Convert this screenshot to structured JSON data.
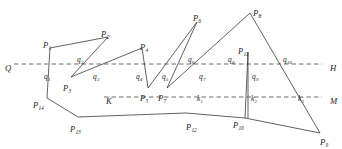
{
  "figure": {
    "type": "geometry-diagram",
    "width": 342,
    "height": 149,
    "background_color": "#ffffff",
    "stroke_color": "#3a3a3a",
    "dash_color": "#5a5a5a"
  },
  "axes": [
    {
      "id": "line-QH",
      "left_label": "Q",
      "right_label": "H",
      "y": 64,
      "x_start": 14,
      "x_end": 322,
      "style": "dashed"
    },
    {
      "id": "line-KM",
      "left_label": "K",
      "right_label": "M",
      "y": 97,
      "x_start": 104,
      "x_end": 322,
      "style": "dashed"
    }
  ],
  "axis_labels": [
    {
      "name": "axis-label-Q",
      "base": "Q",
      "sub": "",
      "x": 5,
      "y": 58
    },
    {
      "name": "axis-label-H",
      "base": "H",
      "sub": "",
      "x": 330,
      "y": 58
    },
    {
      "name": "axis-label-K",
      "base": "K",
      "sub": "",
      "x": 106,
      "y": 91
    },
    {
      "name": "axis-label-M",
      "base": "M",
      "sub": "",
      "x": 330,
      "y": 91
    }
  ],
  "chain": {
    "name": "polygon-chain",
    "points": "50,48 108,37 71,77 142,48 148,88 197,22 167,88 250,13 320,133 245,118 248,52 248,118 245,118 186,113 47,110 47,98 50,48",
    "vertex_order": [
      "P1",
      "P2",
      "P3",
      "P4",
      "P5",
      "P6",
      "P7",
      "P8",
      "P9",
      "P10",
      "P11",
      "P10",
      "P12",
      "P13",
      "P14",
      "P1"
    ]
  },
  "segments": [
    {
      "name": "segment-P1-P2",
      "d": "M 50,48 L 108,37"
    },
    {
      "name": "segment-P2-P3",
      "d": "M 108,37 L 71,77"
    },
    {
      "name": "segment-P3-P4",
      "d": "M 71,77 L 142,48"
    },
    {
      "name": "segment-P4-P5",
      "d": "M 142,48 L 148,88"
    },
    {
      "name": "segment-P5-P6",
      "d": "M 148,88 L 197,22"
    },
    {
      "name": "segment-P6-P7",
      "d": "M 197,22 L 167,88"
    },
    {
      "name": "segment-P7-P8",
      "d": "M 167,88 L 250,13"
    },
    {
      "name": "segment-P8-P9",
      "d": "M 250,13 L 320,133"
    },
    {
      "name": "segment-P9-P10",
      "d": "M 320,133 L 245,118"
    },
    {
      "name": "segment-P10-P11",
      "d": "M 245,118 L 248,52"
    },
    {
      "name": "segment-P11-down",
      "d": "M 248,52 L 248,118"
    },
    {
      "name": "segment-P10-P12",
      "d": "M 245,118 L 186,113"
    },
    {
      "name": "segment-P12-P13",
      "d": "M 186,113 L 78,117"
    },
    {
      "name": "segment-P13-P14",
      "d": "M 78,117 L 47,98"
    },
    {
      "name": "segment-P14-P1",
      "d": "M 47,98 L 50,48"
    }
  ],
  "vertices": [
    {
      "name": "vertex-label-P1",
      "base": "P",
      "sub": "1",
      "x": 43,
      "y": 35
    },
    {
      "name": "vertex-label-P2",
      "base": "P",
      "sub": "2",
      "x": 101,
      "y": 24
    },
    {
      "name": "vertex-label-P3",
      "base": "P",
      "sub": "3",
      "x": 63,
      "y": 78
    },
    {
      "name": "vertex-label-P4",
      "base": "P",
      "sub": "4",
      "x": 140,
      "y": 37
    },
    {
      "name": "vertex-label-P5",
      "base": "P",
      "sub": "5",
      "x": 140,
      "y": 88
    },
    {
      "name": "vertex-label-P6",
      "base": "P",
      "sub": "6",
      "x": 193,
      "y": 8
    },
    {
      "name": "vertex-label-P7",
      "base": "P",
      "sub": "7",
      "x": 158,
      "y": 88
    },
    {
      "name": "vertex-label-P8",
      "base": "P",
      "sub": "8",
      "x": 253,
      "y": 3
    },
    {
      "name": "vertex-label-P9",
      "base": "P",
      "sub": "9",
      "x": 320,
      "y": 132
    },
    {
      "name": "vertex-label-P10",
      "base": "P",
      "sub": "10",
      "x": 233,
      "y": 115
    },
    {
      "name": "vertex-label-P11",
      "base": "P",
      "sub": "11",
      "x": 238,
      "y": 41
    },
    {
      "name": "vertex-label-P12",
      "base": "P",
      "sub": "12",
      "x": 186,
      "y": 117
    },
    {
      "name": "vertex-label-P13",
      "base": "P",
      "sub": "13",
      "x": 70,
      "y": 119
    },
    {
      "name": "vertex-label-P14",
      "base": "P",
      "sub": "14",
      "x": 33,
      "y": 95
    }
  ],
  "intersections_h": [
    {
      "name": "intersection-label-q1",
      "base": "q",
      "sub": "1",
      "x": 44,
      "y": 66
    },
    {
      "name": "intersection-label-q2",
      "base": "q",
      "sub": "2",
      "x": 77,
      "y": 49
    },
    {
      "name": "intersection-label-q3",
      "base": "q",
      "sub": "3",
      "x": 93,
      "y": 66
    },
    {
      "name": "intersection-label-q4",
      "base": "q",
      "sub": "4",
      "x": 136,
      "y": 66
    },
    {
      "name": "intersection-label-q5",
      "base": "q",
      "sub": "5",
      "x": 162,
      "y": 66
    },
    {
      "name": "intersection-label-q6",
      "base": "q",
      "sub": "6",
      "x": 188,
      "y": 49
    },
    {
      "name": "intersection-label-q7",
      "base": "q",
      "sub": "7",
      "x": 199,
      "y": 66
    },
    {
      "name": "intersection-label-q8",
      "base": "q",
      "sub": "8",
      "x": 228,
      "y": 49
    },
    {
      "name": "intersection-label-q9",
      "base": "q",
      "sub": "9",
      "x": 252,
      "y": 66
    },
    {
      "name": "intersection-label-q10",
      "base": "q",
      "sub": "10",
      "x": 283,
      "y": 49
    }
  ],
  "intersections_k": [
    {
      "name": "intersection-label-k1",
      "base": "k",
      "sub": "1",
      "x": 197,
      "y": 88
    },
    {
      "name": "intersection-label-k2",
      "base": "k",
      "sub": "2",
      "x": 251,
      "y": 88
    },
    {
      "name": "intersection-label-k3",
      "base": "k",
      "sub": "3",
      "x": 298,
      "y": 88
    }
  ]
}
